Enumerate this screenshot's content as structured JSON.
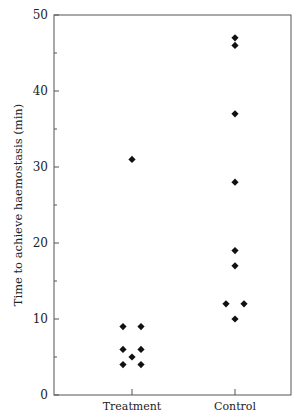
{
  "chart_data": {
    "type": "scatter",
    "title": "",
    "xlabel": "",
    "ylabel": "Time to achieve haemostasis (min)",
    "categories": [
      "Treatment",
      "Control"
    ],
    "ylim": [
      0,
      50
    ],
    "yticks": [
      0,
      10,
      20,
      30,
      40,
      50
    ],
    "yminor_ticks": [
      5,
      15,
      25,
      35,
      45
    ],
    "grid": false,
    "legend": "none",
    "marker": "diamond",
    "marker_color": "#111111",
    "series": [
      {
        "name": "Treatment",
        "points": [
          {
            "offset": 0,
            "y": 31
          },
          {
            "offset": -1,
            "y": 9
          },
          {
            "offset": 1,
            "y": 9
          },
          {
            "offset": -1,
            "y": 6
          },
          {
            "offset": 1,
            "y": 6
          },
          {
            "offset": 0,
            "y": 5
          },
          {
            "offset": -1,
            "y": 4
          },
          {
            "offset": 1,
            "y": 4
          }
        ]
      },
      {
        "name": "Control",
        "points": [
          {
            "offset": 0,
            "y": 47
          },
          {
            "offset": 0,
            "y": 46
          },
          {
            "offset": 0,
            "y": 37
          },
          {
            "offset": 0,
            "y": 28
          },
          {
            "offset": 0,
            "y": 19
          },
          {
            "offset": 0,
            "y": 17
          },
          {
            "offset": -1,
            "y": 12
          },
          {
            "offset": 1,
            "y": 12
          },
          {
            "offset": 0,
            "y": 10
          }
        ]
      }
    ]
  }
}
